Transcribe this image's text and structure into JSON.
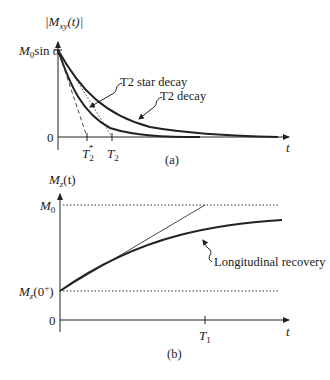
{
  "figure": {
    "panel_a": {
      "caption": "(a)",
      "y_axis_label": "|M",
      "y_axis_label_sub": "xy",
      "y_axis_label_suffix": "(t)|",
      "y_top_tick_label_main": "M",
      "y_top_tick_label_sub": "0",
      "y_top_tick_label_suffix": "sin α",
      "y_zero_label": "0",
      "x_axis_label": "t",
      "x_ticks": [
        {
          "label": "T",
          "sub": "2",
          "sup": "*"
        },
        {
          "label": "T",
          "sub": "2",
          "sup": ""
        }
      ],
      "annotations": [
        {
          "text": "T2 star decay"
        },
        {
          "text": "T2 decay"
        }
      ]
    },
    "panel_b": {
      "caption": "(b)",
      "y_axis_label": "M",
      "y_axis_label_sub": "z",
      "y_axis_label_suffix": "(t)",
      "y_top_label_main": "M",
      "y_top_label_sub": "0",
      "y_init_label_main": "M",
      "y_init_label_sub": "z",
      "y_init_label_suffix": "(0",
      "y_init_label_sup": "+",
      "y_init_label_close": ")",
      "y_zero_label": "0",
      "x_axis_label": "t",
      "x_ticks": [
        {
          "label": "T",
          "sub": "1"
        }
      ],
      "annotations": [
        {
          "text": "Longitudinal recovery"
        }
      ]
    }
  }
}
